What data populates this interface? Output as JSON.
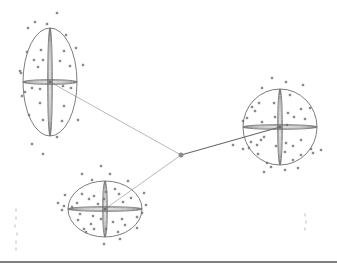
{
  "diagram": {
    "width": 337,
    "height": 266,
    "colors": {
      "background": "#ffffff",
      "ellipse_stroke": "#6e6e6e",
      "point_fill": "#8a8a8a",
      "link_stroke": "#b0b0b0",
      "strong_link_stroke": "#6a6a6a",
      "hub_fill": "#8c8c8c",
      "baseline": "#555555"
    },
    "hub": {
      "x": 181,
      "y": 155,
      "r": 2.5
    },
    "clusters": [
      {
        "id": "cluster-top-left",
        "cx": 50,
        "cy": 82,
        "rx": 27,
        "ry": 54,
        "link": {
          "strength": "weak"
        },
        "points": [
          [
            57,
            13
          ],
          [
            35,
            22
          ],
          [
            47,
            24
          ],
          [
            28,
            28
          ],
          [
            66,
            35
          ],
          [
            41,
            50
          ],
          [
            64,
            51
          ],
          [
            27,
            52
          ],
          [
            34,
            60
          ],
          [
            43,
            60
          ],
          [
            76,
            48
          ],
          [
            21,
            73
          ],
          [
            60,
            61
          ],
          [
            70,
            66
          ],
          [
            38,
            67
          ],
          [
            83,
            65
          ],
          [
            32,
            88
          ],
          [
            40,
            89
          ],
          [
            71,
            88
          ],
          [
            22,
            96
          ],
          [
            25,
            92
          ],
          [
            40,
            103
          ],
          [
            64,
            106
          ],
          [
            29,
            115
          ],
          [
            43,
            120
          ],
          [
            78,
            120
          ],
          [
            62,
            121
          ],
          [
            57,
            137
          ],
          [
            32,
            144
          ],
          [
            43,
            154
          ],
          [
            20,
            71
          ],
          [
            63,
            86
          ]
        ]
      },
      {
        "id": "cluster-right",
        "cx": 280,
        "cy": 127,
        "rx": 37,
        "ry": 38,
        "link": {
          "strength": "strong"
        },
        "points": [
          [
            272,
            78
          ],
          [
            286,
            82
          ],
          [
            262,
            88
          ],
          [
            303,
            85
          ],
          [
            290,
            95
          ],
          [
            259,
            103
          ],
          [
            274,
            103
          ],
          [
            252,
            107
          ],
          [
            301,
            109
          ],
          [
            310,
            108
          ],
          [
            255,
            111
          ],
          [
            262,
            122
          ],
          [
            288,
            113
          ],
          [
            275,
            117
          ],
          [
            294,
            117
          ],
          [
            247,
            118
          ],
          [
            305,
            119
          ],
          [
            279,
            127
          ],
          [
            287,
            125
          ],
          [
            243,
            121
          ],
          [
            261,
            140
          ],
          [
            251,
            142
          ],
          [
            257,
            145
          ],
          [
            264,
            137
          ],
          [
            276,
            146
          ],
          [
            286,
            143
          ],
          [
            301,
            140
          ],
          [
            293,
            146
          ],
          [
            311,
            149
          ],
          [
            243,
            149
          ],
          [
            285,
            152
          ],
          [
            258,
            154
          ],
          [
            301,
            155
          ],
          [
            313,
            153
          ],
          [
            267,
            163
          ],
          [
            293,
            160
          ],
          [
            271,
            167
          ],
          [
            298,
            168
          ],
          [
            285,
            170
          ],
          [
            264,
            172
          ],
          [
            249,
            148
          ],
          [
            321,
            150
          ],
          [
            233,
            145
          ]
        ]
      },
      {
        "id": "cluster-bottom",
        "cx": 105,
        "cy": 209,
        "rx": 37,
        "ry": 28,
        "link": {
          "strength": "weak"
        },
        "points": [
          [
            101,
            166
          ],
          [
            82,
            174
          ],
          [
            110,
            174
          ],
          [
            92,
            180
          ],
          [
            128,
            181
          ],
          [
            115,
            189
          ],
          [
            106,
            192
          ],
          [
            119,
            194
          ],
          [
            65,
            195
          ],
          [
            82,
            194
          ],
          [
            94,
            196
          ],
          [
            144,
            193
          ],
          [
            89,
            199
          ],
          [
            104,
            199
          ],
          [
            131,
            198
          ],
          [
            77,
            203
          ],
          [
            98,
            204
          ],
          [
            123,
            202
          ],
          [
            146,
            205
          ],
          [
            64,
            206
          ],
          [
            72,
            207
          ],
          [
            142,
            213
          ],
          [
            80,
            214
          ],
          [
            93,
            216
          ],
          [
            101,
            219
          ],
          [
            113,
            222
          ],
          [
            122,
            219
          ],
          [
            137,
            217
          ],
          [
            78,
            220
          ],
          [
            91,
            224
          ],
          [
            125,
            225
          ],
          [
            106,
            229
          ],
          [
            137,
            228
          ],
          [
            118,
            232
          ],
          [
            94,
            229
          ],
          [
            120,
            239
          ],
          [
            104,
            244
          ],
          [
            58,
            203
          ],
          [
            62,
            210
          ],
          [
            84,
            229
          ],
          [
            86,
            232
          ]
        ]
      }
    ],
    "baseline": {
      "y": 262,
      "x1": 0,
      "x2": 337
    },
    "artifact_marks": [
      [
        16,
        210
      ],
      [
        16,
        218
      ],
      [
        15,
        226
      ],
      [
        17,
        234
      ],
      [
        16,
        242
      ],
      [
        16,
        249
      ],
      [
        305,
        215
      ],
      [
        306,
        222
      ],
      [
        305,
        229
      ]
    ]
  }
}
